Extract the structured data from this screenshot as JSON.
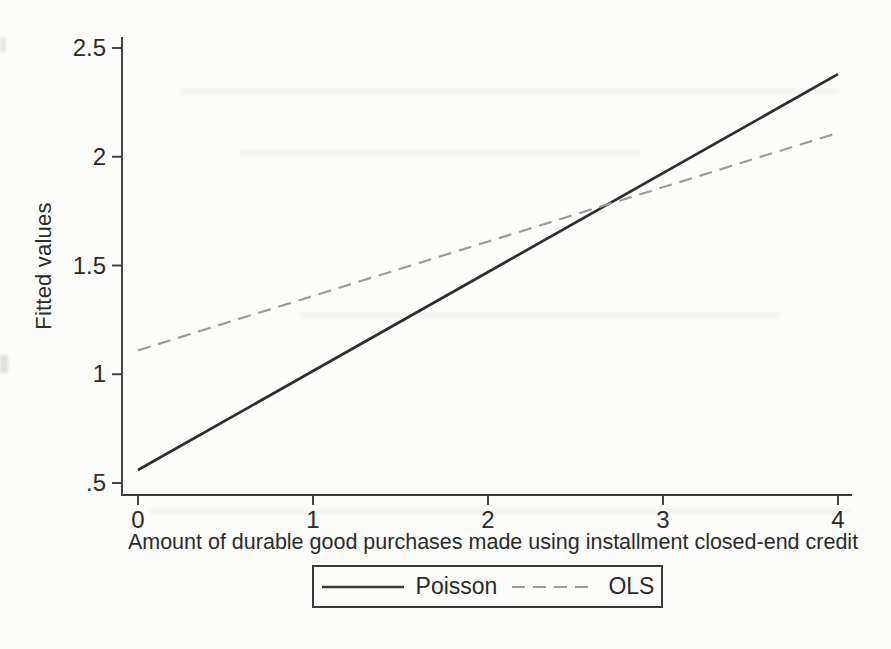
{
  "figure": {
    "background": "#fcfcfa",
    "text_color": "#2b2b2b",
    "axis_color": "#3c3c3c"
  },
  "chart_data": {
    "type": "line",
    "title": "",
    "xlabel": "Amount of durable good purchases made using installment closed-end credit",
    "ylabel": "Fitted values",
    "xlim": [
      0,
      4
    ],
    "ylim": [
      0.5,
      2.5
    ],
    "x_ticks": [
      0,
      1,
      2,
      3,
      4
    ],
    "x_tick_labels": [
      "0",
      "1",
      "2",
      "3",
      "4"
    ],
    "y_ticks": [
      0.5,
      1,
      1.5,
      2,
      2.5
    ],
    "y_tick_labels": [
      ".5",
      "1",
      "1.5",
      "2",
      "2.5"
    ],
    "grid": false,
    "legend_position": "bottom-center",
    "intersection": {
      "x": 2.7,
      "y": 1.79
    },
    "series": [
      {
        "name": "Poisson",
        "style": "solid",
        "color": "#2e2e2e",
        "x": [
          0,
          4
        ],
        "y": [
          0.56,
          2.38
        ]
      },
      {
        "name": "OLS",
        "style": "dashed",
        "color": "#9c9c9c",
        "x": [
          0,
          4
        ],
        "y": [
          1.11,
          2.11
        ]
      }
    ]
  }
}
